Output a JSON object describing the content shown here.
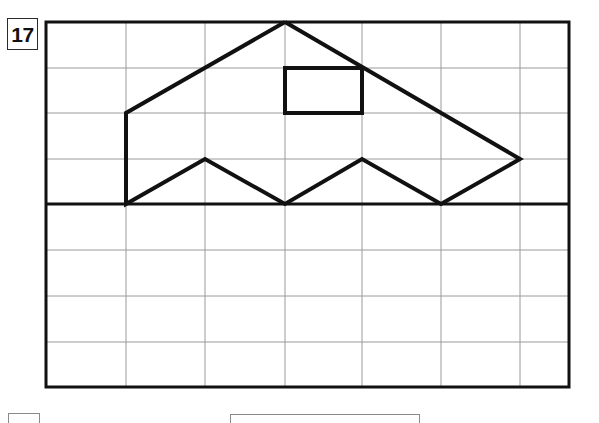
{
  "worksheet": {
    "item_number": "17",
    "item_number_box_label": "problem-number",
    "background_color": "#ffffff"
  },
  "grid": {
    "description": "Rectangular coordinate grid of thin rules with a heavy horizontal mid-rule acting as a baseline / mirror line",
    "outer_border_color": "#111111",
    "outer_border_width_px": 3,
    "thin_line_color": "#9a9a9a",
    "thin_line_width_px": 1,
    "heavy_line_color": "#111111",
    "heavy_line_width_px": 3,
    "left_px": 46,
    "right_px": 569,
    "top_px": 22,
    "bottom_px": 387,
    "vertical_lines_px": [
      46,
      126,
      205,
      285,
      362,
      441,
      520,
      569
    ],
    "horizontal_lines_px": [
      22,
      68,
      113,
      159,
      204,
      250,
      296,
      342,
      387
    ],
    "heavy_horizontal_line_y_px": 204,
    "columns": 7,
    "rows_above_baseline": 4,
    "rows_below_baseline": 4
  },
  "figure": {
    "name": "boat-shaped-polygon",
    "stroke_color": "#111111",
    "stroke_width_px": 4,
    "fill": "none",
    "outline_points_px": [
      [
        285,
        22
      ],
      [
        126,
        113
      ],
      [
        126,
        204
      ],
      [
        205,
        159
      ],
      [
        285,
        204
      ],
      [
        362,
        159
      ],
      [
        441,
        204
      ],
      [
        520,
        159
      ]
    ],
    "inner_rectangle_px": {
      "x": 285,
      "y": 68,
      "width": 77,
      "height": 45,
      "stroke_color": "#111111",
      "stroke_width_px": 4
    }
  },
  "bottom_cut_elements": {
    "note": "partially visible tops of boxes cropped by the page edge",
    "left_box_label": "cut-off-box-left",
    "right_box_label": "cut-off-box-right"
  }
}
